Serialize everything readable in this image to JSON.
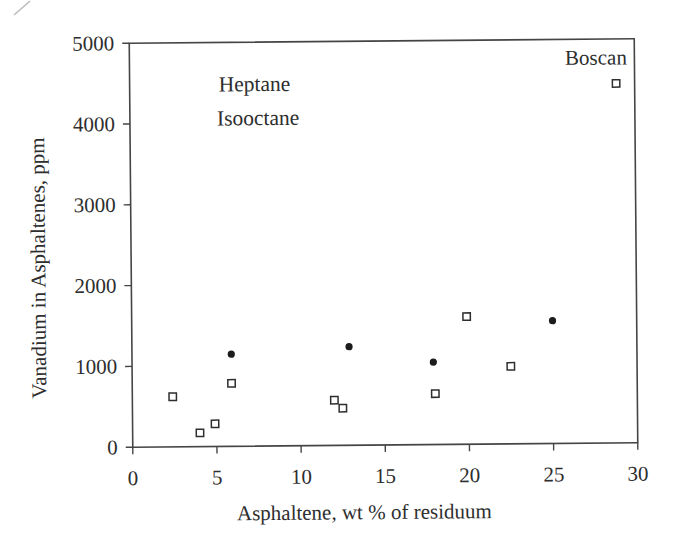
{
  "figure": {
    "background_color": "#ffffff",
    "ink_color": "#2e2e2e",
    "line_color": "#454545",
    "point_color": "#1c1c1c"
  },
  "chart_data": {
    "type": "scatter",
    "title": "",
    "xlabel": "Asphaltene, wt % of residuum",
    "ylabel": "Vanadium in Asphaltenes, ppm",
    "xlim": [
      0,
      30
    ],
    "ylim": [
      0,
      5000
    ],
    "x_ticks": [
      0,
      5,
      10,
      15,
      20,
      25,
      30
    ],
    "x_tick_labels": [
      "0",
      "5",
      "10",
      "15",
      "20",
      "25",
      "30"
    ],
    "y_ticks": [
      0,
      1000,
      2000,
      3000,
      4000,
      5000
    ],
    "y_tick_labels": [
      "0",
      "1000",
      "2000",
      "3000",
      "4000",
      "5000"
    ],
    "grid": false,
    "frame": "full-box",
    "legend_position": "inside-top-left-text-only",
    "legend_labels": [
      "Heptane",
      "Isooctane"
    ],
    "series": [
      {
        "name": "Heptane",
        "marker": "filled-circle",
        "color": "#1c1c1c",
        "points": [
          [
            5.9,
            1140
          ],
          [
            12.9,
            1220
          ],
          [
            17.9,
            1020
          ],
          [
            25.0,
            1520
          ]
        ]
      },
      {
        "name": "Isooctane",
        "marker": "open-square",
        "color": "#2e2e2e",
        "points": [
          [
            2.4,
            620
          ],
          [
            4.0,
            170
          ],
          [
            4.9,
            280
          ],
          [
            5.9,
            780
          ],
          [
            12.0,
            560
          ],
          [
            12.5,
            460
          ],
          [
            18.0,
            630
          ],
          [
            19.9,
            1580
          ],
          [
            22.5,
            960
          ],
          [
            28.9,
            4450
          ]
        ]
      }
    ],
    "annotations": [
      {
        "text": "Boscan",
        "x": 28.9,
        "y": 4450
      }
    ]
  }
}
